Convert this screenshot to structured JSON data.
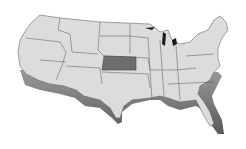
{
  "map": {
    "subject": "United States",
    "style": "3D extruded grayscale",
    "highlighted_state": "Kansas",
    "colors": {
      "background": "#ffffff",
      "land_top": "#dcdcdc",
      "land_side": "#8a8a8a",
      "borders": "#555555",
      "highlight": "#6e6e6e",
      "water": "#1a1a1a"
    }
  }
}
